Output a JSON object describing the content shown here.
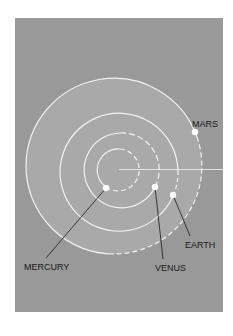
{
  "diagram": {
    "type": "orbit-diagram",
    "colors": {
      "page_background": "#ffffff",
      "panel_background": "#999999",
      "mars_disk": "#a9a9a9",
      "orbit_line": "#f2f2f2",
      "planet": "#ffffff",
      "leader_line": "#2a2a2a",
      "label_text": "#1a1a1a"
    },
    "planets": [
      {
        "name": "mercury",
        "label": "MERCURY"
      },
      {
        "name": "venus",
        "label": "VENUS"
      },
      {
        "name": "earth",
        "label": "EARTH"
      },
      {
        "name": "mars",
        "label": "MARS"
      }
    ]
  }
}
